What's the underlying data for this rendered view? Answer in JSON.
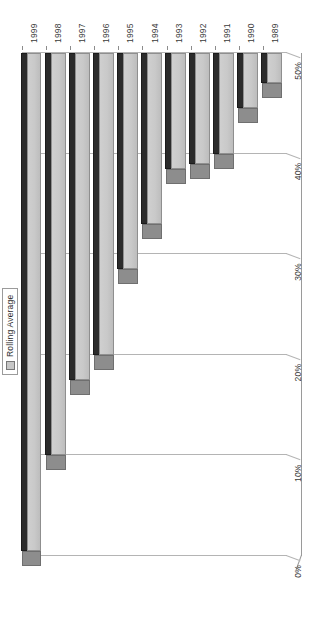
{
  "chart_data": {
    "type": "bar",
    "orientation": "horizontal-3d",
    "title": "",
    "subtitle": "",
    "xlabel": "",
    "ylabel": "",
    "grid": true,
    "legend_position": "top-right",
    "categories": [
      "1989",
      "1990",
      "1991",
      "1992",
      "1993",
      "1994",
      "1995",
      "1996",
      "1997",
      "1998",
      "1999"
    ],
    "series": [
      {
        "name": "Rolling Average",
        "values": [
          3,
          5.5,
          10,
          11,
          11.5,
          17,
          21.5,
          30,
          32.5,
          40,
          49.5
        ]
      }
    ],
    "ylim": [
      0,
      50
    ],
    "ytick_labels": [
      "0%",
      "10%",
      "20%",
      "30%",
      "40%",
      "50%"
    ],
    "ytick_values": [
      0,
      10,
      20,
      30,
      40,
      50
    ],
    "value_suffix": "%"
  },
  "legend": {
    "entries": [
      {
        "label": "Rolling Average",
        "swatch_color": "#c6c6c6",
        "icon": "legend-swatch-icon"
      }
    ]
  },
  "colors": {
    "bar_face": "#c9c9c9",
    "bar_top": "#2b2b2b",
    "bar_side": "#8d8d8d",
    "gridline": "#b4b4b4",
    "axis": "#8c8c8c",
    "text": "#3a3a3a",
    "background": "#ffffff"
  },
  "axes": {
    "category_axis_name": "year-axis",
    "value_axis_name": "percent-axis"
  }
}
